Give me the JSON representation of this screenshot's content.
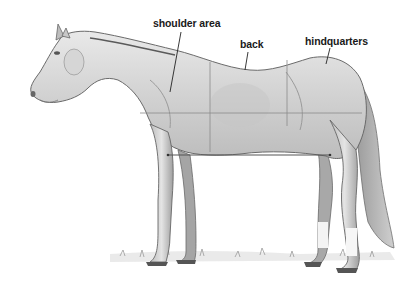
{
  "diagram": {
    "labels": [
      {
        "id": "shoulder",
        "text": "shoulder area",
        "x": 153,
        "y": 17
      },
      {
        "id": "back",
        "text": "back",
        "x": 240,
        "y": 38
      },
      {
        "id": "hindquarters",
        "text": "hindquarters",
        "x": 305,
        "y": 35
      }
    ],
    "colors": {
      "label_text": "#1a1a1a",
      "guide_line": "#8a8a8a",
      "measure_line": "#555555",
      "background": "#ffffff"
    }
  }
}
